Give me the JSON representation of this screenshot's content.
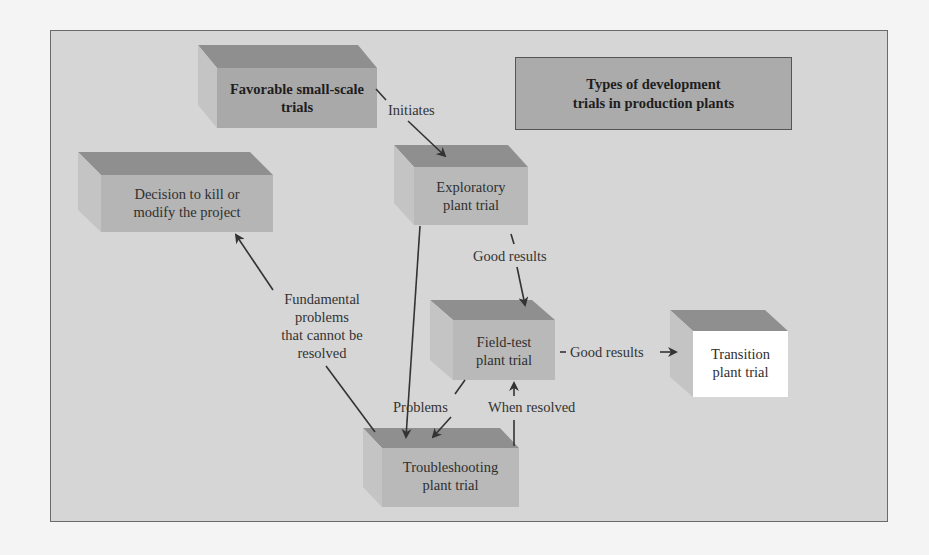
{
  "title": {
    "line1": "Types of development",
    "line2": "trials in production plants"
  },
  "nodes": {
    "favorable": {
      "line1": "Favorable small-scale",
      "line2": "trials"
    },
    "decision": {
      "line1": "Decision to kill or",
      "line2": "modify the project"
    },
    "exploratory": {
      "line1": "Exploratory",
      "line2": "plant trial"
    },
    "field_test": {
      "line1": "Field-test",
      "line2": "plant trial"
    },
    "troubleshooting": {
      "line1": "Troubleshooting",
      "line2": "plant trial"
    },
    "transition": {
      "line1": "Transition",
      "line2": "plant trial"
    }
  },
  "edges": {
    "initiates": "Initiates",
    "good_results_1": "Good results",
    "good_results_2": "Good results",
    "fundamental": {
      "line1": "Fundamental",
      "line2": "problems",
      "line3": "that cannot be",
      "line4": "resolved"
    },
    "problems": "Problems",
    "when_resolved": "When resolved"
  },
  "colors": {
    "background": "#d6d6d6",
    "box_front": "#b9b9b9",
    "box_top": "#8f8f8f",
    "box_side": "#c8c8c8",
    "transition_front": "#ffffff",
    "title_box": "#ababab",
    "arrow": "#333333"
  }
}
